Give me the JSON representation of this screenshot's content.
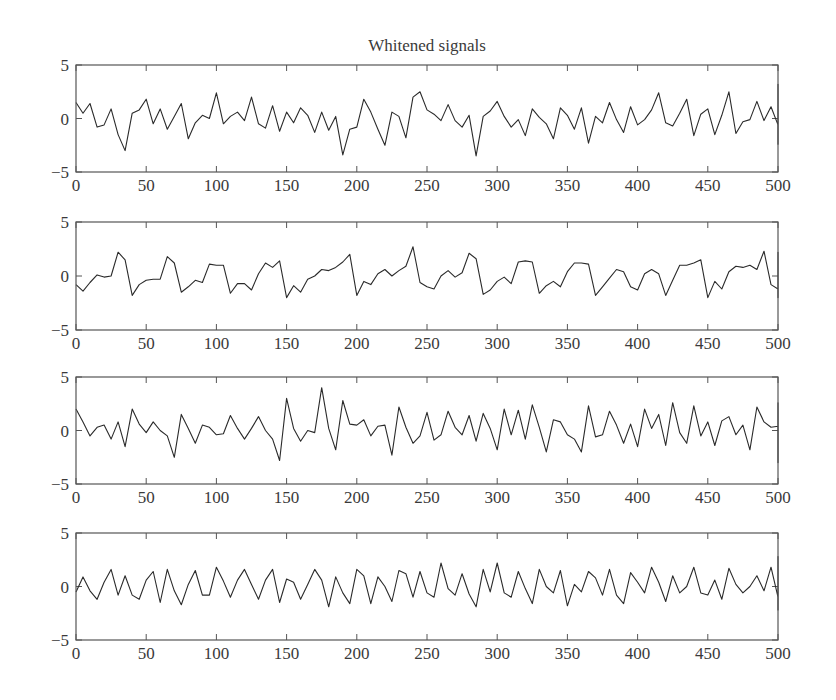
{
  "figure": {
    "title": "Whitened signals"
  },
  "layout": {
    "plot_left": 76,
    "plot_right": 778,
    "plots_y": [
      [
        65,
        172
      ],
      [
        222,
        330
      ],
      [
        377,
        484
      ],
      [
        533,
        640
      ]
    ],
    "line_color": "#2a2a2a",
    "axis_color": "#555555"
  },
  "chart_data": [
    {
      "type": "line",
      "title": "Whitened signals",
      "name": "signal 1",
      "xlabel": "",
      "ylabel": "",
      "xlim": [
        0,
        500
      ],
      "ylim": [
        -5,
        5
      ],
      "xticks": [
        0,
        50,
        100,
        150,
        200,
        250,
        300,
        350,
        400,
        450,
        500
      ],
      "yticks": [
        -5,
        0,
        5
      ],
      "grid": false,
      "x_step": 5,
      "values": [
        1.5,
        0.5,
        1.4,
        -0.8,
        -0.6,
        0.9,
        -1.5,
        -3.0,
        0.5,
        0.8,
        1.8,
        -0.5,
        0.9,
        -1.0,
        0.2,
        1.4,
        -1.9,
        -0.4,
        0.3,
        0.0,
        2.4,
        -0.5,
        0.2,
        0.6,
        -0.2,
        2.0,
        -0.5,
        -0.9,
        1.2,
        -1.2,
        0.6,
        -0.4,
        1.0,
        0.3,
        -1.3,
        0.6,
        -1.1,
        0.2,
        -3.4,
        -1.0,
        -0.8,
        1.8,
        0.6,
        -1.0,
        -2.5,
        0.6,
        0.2,
        -1.8,
        2.0,
        2.5,
        0.8,
        0.4,
        -0.2,
        1.3,
        -0.2,
        -0.8,
        0.3,
        -3.5,
        0.2,
        0.7,
        1.6,
        0.2,
        -0.8,
        -0.1,
        -1.6,
        0.9,
        0.1,
        -0.5,
        -1.9,
        1.0,
        0.3,
        -1.0,
        1.0,
        -2.3,
        0.2,
        -0.4,
        1.5,
        -0.1,
        -1.3,
        1.1,
        -0.6,
        -0.1,
        0.8,
        2.4,
        -0.4,
        -0.7,
        0.5,
        1.8,
        -1.6,
        0.4,
        0.9,
        -1.5,
        0.3,
        2.5,
        -1.4,
        -0.3,
        -0.1,
        1.6,
        -0.2,
        1.1,
        -0.6,
        2.0,
        0.3,
        -1.2,
        1.5,
        0.8,
        -2.3,
        0.3,
        0.5,
        1.0,
        0.2,
        -0.6,
        1.4,
        0.1,
        -0.4,
        2.3,
        -0.9,
        0.5,
        -0.2,
        0.8,
        0.0,
        1.2,
        1.6,
        -0.3,
        0.5,
        -0.7,
        0.8,
        -0.5,
        -1.0,
        0.2,
        -1.5,
        -1.0,
        3.2,
        0.0,
        1.6,
        -1.3,
        1.5,
        -0.9,
        -1.5,
        2.6,
        -0.6,
        0.8,
        -0.9,
        1.4,
        -2.0,
        -1.4,
        0.9,
        1.6,
        -0.1,
        -0.5,
        0.4,
        -1.0,
        0.4,
        -2.0,
        -0.3,
        0.7,
        1.2,
        -0.8,
        0.8,
        -1.6,
        0.2,
        0.6,
        1.0,
        -0.7,
        0.6,
        0.4,
        -0.3,
        2.0,
        1.0,
        -0.3,
        -0.6,
        0.2,
        -0.9,
        -2.4,
        -0.8,
        1.1,
        -0.3,
        0.8,
        0.4,
        -0.5,
        -0.2
      ],
      "color": "#2a2a2a"
    },
    {
      "type": "line",
      "name": "signal 2",
      "xlim": [
        0,
        500
      ],
      "ylim": [
        -5,
        5
      ],
      "xticks": [
        0,
        50,
        100,
        150,
        200,
        250,
        300,
        350,
        400,
        450,
        500
      ],
      "yticks": [
        -5,
        0,
        5
      ],
      "grid": false,
      "x_step": 5,
      "values": [
        -0.8,
        -1.4,
        -0.6,
        0.1,
        -0.1,
        0.0,
        2.2,
        1.5,
        -1.8,
        -0.8,
        -0.4,
        -0.3,
        -0.3,
        1.8,
        1.2,
        -1.5,
        -1.0,
        -0.4,
        -0.6,
        1.1,
        1.0,
        1.0,
        -1.6,
        -0.7,
        -0.7,
        -1.3,
        0.2,
        1.2,
        0.8,
        1.4,
        -2.0,
        -0.9,
        -1.5,
        -0.3,
        0.0,
        0.6,
        0.5,
        0.8,
        1.3,
        2.0,
        -1.8,
        -0.5,
        -0.8,
        0.2,
        0.6,
        0.0,
        0.5,
        0.9,
        2.7,
        -0.6,
        -1.0,
        -1.2,
        0.0,
        0.5,
        -0.1,
        0.3,
        2.1,
        1.6,
        -1.7,
        -1.3,
        -0.5,
        -0.1,
        -0.7,
        1.3,
        1.4,
        1.3,
        -1.6,
        -0.9,
        -0.5,
        -1.0,
        0.4,
        1.2,
        1.2,
        1.1,
        -1.8,
        -1.0,
        -0.2,
        0.6,
        0.4,
        -1.0,
        -1.3,
        0.2,
        0.6,
        0.2,
        -1.8,
        -0.4,
        1.0,
        1.0,
        1.2,
        1.5,
        -2.0,
        -0.5,
        -1.2,
        0.4,
        0.9,
        0.8,
        1.0,
        0.6,
        2.3,
        -0.8,
        -1.2,
        -0.5,
        0.7,
        0.6,
        1.8,
        2.0,
        -1.5,
        -1.4,
        0.3,
        -0.1,
        1.8,
        2.0,
        1.5,
        -2.0,
        -1.0,
        -0.8,
        0.2,
        1.3,
        1.4,
        -0.5,
        -1.8,
        -1.2,
        -0.4,
        -0.2,
        0.8,
        1.6,
        1.4,
        -1.8,
        -1.0,
        -0.6,
        -0.2,
        -0.2,
        0.8,
        1.6,
        0.6,
        -1.6,
        -1.3,
        0.0,
        0.2,
        1.2,
        1.5,
        1.3,
        0.6,
        -1.8,
        -0.9,
        -1.2,
        -0.4,
        -0.2,
        1.0,
        0.8,
        1.2,
        2.2,
        -1.0,
        -1.2,
        -1.1,
        -1.0,
        -0.2,
        0.6
      ],
      "color": "#2a2a2a"
    },
    {
      "type": "line",
      "name": "signal 3",
      "xlim": [
        0,
        500
      ],
      "ylim": [
        -5,
        5
      ],
      "xticks": [
        0,
        50,
        100,
        150,
        200,
        250,
        300,
        350,
        400,
        450,
        500
      ],
      "yticks": [
        -5,
        0,
        5
      ],
      "grid": false,
      "x_step": 5,
      "values": [
        2.0,
        0.8,
        -0.5,
        0.3,
        0.5,
        -0.8,
        0.8,
        -1.5,
        2.0,
        0.6,
        -0.2,
        0.8,
        0.0,
        -0.5,
        -2.5,
        1.5,
        0.2,
        -1.2,
        0.5,
        0.3,
        -0.4,
        -0.3,
        1.4,
        0.2,
        -0.8,
        0.2,
        1.3,
        0.0,
        -0.8,
        -2.8,
        3.0,
        0.2,
        -1.0,
        0.0,
        -0.2,
        4.0,
        0.2,
        -1.8,
        2.8,
        0.6,
        0.5,
        1.0,
        -0.5,
        0.4,
        0.5,
        -2.3,
        2.2,
        0.3,
        -1.2,
        -0.5,
        1.7,
        -0.9,
        -0.4,
        1.8,
        0.3,
        -0.4,
        1.4,
        -1.0,
        1.6,
        0.2,
        -1.8,
        2.0,
        -0.4,
        1.9,
        -0.8,
        2.4,
        0.3,
        -2.0,
        1.0,
        0.8,
        -0.4,
        -0.8,
        -2.0,
        2.3,
        -0.6,
        -0.4,
        1.8,
        0.5,
        -1.2,
        0.6,
        -1.5,
        2.0,
        0.2,
        1.5,
        -1.4,
        2.6,
        -0.2,
        -1.2,
        2.3,
        -0.5,
        0.8,
        -1.4,
        0.9,
        1.3,
        -0.4,
        0.5,
        -1.8,
        2.2,
        0.8,
        0.3,
        0.4,
        -0.3,
        -2.6,
        2.5,
        0.9,
        1.0,
        -0.5,
        0.2,
        -1.5,
        1.8,
        0.3,
        0.6,
        1.2,
        -0.8,
        -1.0,
        0.2,
        -1.6,
        2.0,
        0.4,
        0.1,
        -1.8,
        0.8,
        1.2,
        0.2,
        -1.2,
        2.6,
        0.3,
        -0.8,
        0.5,
        0.0,
        1.0,
        -1.6,
        0.6,
        1.2,
        -0.4,
        -0.1,
        2.0,
        0.3,
        -0.8,
        1.6,
        -0.5,
        -2.0,
        1.8,
        0.2,
        0.5,
        -0.4,
        2.2,
        0.2,
        0.6,
        -0.5,
        0.2,
        -3.0,
        1.8,
        0.2,
        0.4,
        -1.0,
        0.5,
        -0.1,
        1.5,
        0.8,
        0.4,
        0.1,
        0.2,
        -1.2
      ],
      "color": "#2a2a2a"
    },
    {
      "type": "line",
      "name": "signal 4",
      "xlim": [
        0,
        500
      ],
      "ylim": [
        -5,
        5
      ],
      "xticks": [
        0,
        50,
        100,
        150,
        200,
        250,
        300,
        350,
        400,
        450,
        500
      ],
      "yticks": [
        -5,
        0,
        5
      ],
      "grid": false,
      "x_step": 5,
      "values": [
        -0.5,
        0.9,
        -0.4,
        -1.2,
        0.4,
        1.6,
        -0.8,
        1.0,
        -0.8,
        -1.2,
        0.6,
        1.4,
        -1.5,
        1.6,
        -0.4,
        -1.7,
        0.2,
        1.5,
        -0.8,
        -0.8,
        1.8,
        0.5,
        -1.0,
        0.6,
        1.6,
        0.2,
        -1.2,
        0.6,
        1.6,
        -1.5,
        0.7,
        0.4,
        -1.2,
        0.2,
        1.6,
        0.6,
        -1.9,
        0.9,
        -0.6,
        -1.6,
        1.6,
        1.0,
        -1.6,
        0.9,
        0.0,
        -1.4,
        1.5,
        1.2,
        -1.0,
        1.4,
        -0.6,
        -1.0,
        2.2,
        -0.2,
        -0.8,
        1.2,
        -0.7,
        -1.9,
        1.6,
        -0.5,
        2.2,
        -0.6,
        -1.0,
        1.4,
        -0.2,
        -1.6,
        1.6,
        0.0,
        -0.6,
        1.5,
        -1.8,
        0.2,
        -0.5,
        1.4,
        0.8,
        -0.8,
        1.6,
        -0.8,
        -1.6,
        1.3,
        0.4,
        -0.6,
        1.8,
        0.4,
        -1.4,
        1.0,
        -0.6,
        0.0,
        1.8,
        -0.6,
        -0.8,
        0.6,
        -1.2,
        1.7,
        0.2,
        -0.6,
        0.0,
        1.0,
        -0.4,
        1.8,
        -1.0,
        0.4,
        0.6,
        -0.8,
        1.0,
        0.2,
        -0.7,
        1.2,
        0.6,
        -0.5,
        2.0,
        0.3,
        -1.2,
        0.8,
        1.0,
        -0.6,
        -1.0,
        1.8,
        0.5,
        -1.2,
        0.6,
        2.6,
        -0.4,
        -1.4,
        1.6,
        -0.2,
        -1.0,
        1.8,
        1.2,
        -2.2,
        1.2,
        -0.4,
        -0.8,
        2.0,
        1.6,
        -1.4,
        0.4,
        2.8,
        0.6,
        -1.5,
        -0.6,
        1.0,
        0.2,
        -1.5
      ],
      "color": "#2a2a2a"
    }
  ]
}
